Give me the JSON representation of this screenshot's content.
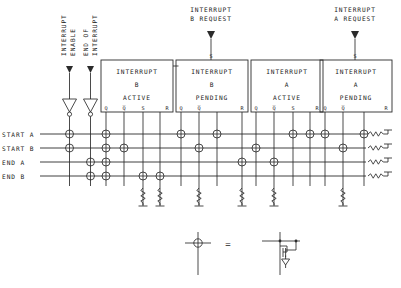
{
  "diagram": {
    "top_labels": [
      {
        "id": "interrupt-enable",
        "text_line1": "INTERRUPT",
        "text_line2": "ENABLE",
        "x": 66,
        "rotated": true
      },
      {
        "id": "end-of-interrupt",
        "text_line1": "END OF",
        "text_line2": "INTERRUPT",
        "x": 88,
        "rotated": true
      },
      {
        "id": "interrupt-b-request",
        "text_line1": "INTERRUPT",
        "text_line2": "B REQUEST",
        "x": 211,
        "rotated": false
      },
      {
        "id": "interrupt-a-request",
        "text_line1": "INTERRUPT",
        "text_line2": "A REQUEST",
        "x": 355,
        "rotated": false
      }
    ],
    "boxes": [
      {
        "id": "interrupt-b-active",
        "l1": "INTERRUPT",
        "l2": "B",
        "l3": "ACTIVE",
        "x": 101,
        "y": 60,
        "w": 72,
        "h": 52,
        "pins_bottom": [
          "Q",
          "Q̅",
          "S",
          "R"
        ],
        "pin_top": null
      },
      {
        "id": "interrupt-b-pending",
        "l1": "INTERRUPT",
        "l2": "B",
        "l3": "PENDING",
        "x": 176,
        "y": 60,
        "w": 72,
        "h": 52,
        "pins_bottom": [
          "Q",
          "Q̅",
          "",
          "R"
        ],
        "pin_top": "S"
      },
      {
        "id": "interrupt-a-active",
        "l1": "INTERRUPT",
        "l2": "A",
        "l3": "ACTIVE",
        "x": 251,
        "y": 60,
        "w": 72,
        "h": 52,
        "pins_bottom": [
          "Q",
          "Q̅",
          "S",
          "R"
        ],
        "pin_top": null
      },
      {
        "id": "interrupt-a-pending",
        "l1": "INTERRUPT",
        "l2": "A",
        "l3": "PENDING",
        "x": 320,
        "y": 60,
        "w": 72,
        "h": 52,
        "pins_bottom": [
          "Q",
          "Q̅",
          "",
          "R"
        ],
        "pin_top": "S"
      }
    ],
    "signal_rows": [
      {
        "id": "start-a",
        "label": "START A",
        "y": 134
      },
      {
        "id": "start-b",
        "label": "START B",
        "y": 148
      },
      {
        "id": "end-a",
        "label": "END  A",
        "y": 162
      },
      {
        "id": "end-b",
        "label": "END  B",
        "y": 176
      }
    ],
    "legend": {
      "equals": "=",
      "symbol_name": "cross-junction-symbol",
      "device_name": "mosfet-transistor-symbol"
    }
  },
  "colors": {
    "ink": "#2b2b2b",
    "paper": "#ffffff",
    "text": "#1a1a1a"
  }
}
